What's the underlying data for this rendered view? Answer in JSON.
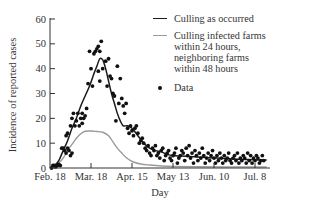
{
  "chart_data": {
    "type": "line",
    "title": "",
    "xlabel": "Day",
    "ylabel": "Incidence of reported cases",
    "ylim": [
      0,
      60
    ],
    "yticks": [
      0,
      10,
      20,
      30,
      40,
      50,
      60
    ],
    "xticks": [
      {
        "label": "Feb. 18",
        "day": 0
      },
      {
        "label": "Mar. 18",
        "day": 28
      },
      {
        "label": "Apr. 15",
        "day": 56
      },
      {
        "label": "May 13",
        "day": 84
      },
      {
        "label": "Jun. 10",
        "day": 112
      },
      {
        "label": "Jul. 8",
        "day": 140
      }
    ],
    "xlim_days": [
      0,
      150
    ],
    "grid": false,
    "legend_position": "upper right",
    "series": [
      {
        "name": "Culling as occurred",
        "style": "line",
        "color": "#1a1a1a",
        "points": [
          [
            0,
            0
          ],
          [
            3,
            1
          ],
          [
            6,
            3
          ],
          [
            9,
            7
          ],
          [
            12,
            11
          ],
          [
            15,
            16
          ],
          [
            18,
            20
          ],
          [
            21,
            25
          ],
          [
            24,
            29
          ],
          [
            27,
            33
          ],
          [
            30,
            38
          ],
          [
            32,
            41
          ],
          [
            34,
            44
          ],
          [
            36,
            43.5
          ],
          [
            38,
            40
          ],
          [
            40,
            35
          ],
          [
            42,
            30
          ],
          [
            44,
            26
          ],
          [
            46,
            22
          ],
          [
            48,
            19
          ],
          [
            50,
            17
          ],
          [
            53,
            17
          ],
          [
            56,
            16
          ],
          [
            60,
            13
          ],
          [
            64,
            10
          ],
          [
            68,
            8
          ],
          [
            72,
            7
          ],
          [
            76,
            6.5
          ],
          [
            80,
            5.5
          ],
          [
            84,
            5
          ],
          [
            90,
            4.8
          ],
          [
            98,
            4.5
          ],
          [
            106,
            4.2
          ],
          [
            114,
            4
          ],
          [
            122,
            3.8
          ],
          [
            130,
            3.5
          ],
          [
            140,
            3.3
          ],
          [
            148,
            3.2
          ]
        ]
      },
      {
        "name": "Culling infected farms within 24 hours, neighboring farms within 48 hours",
        "style": "line",
        "color": "#9a9a9a",
        "points": [
          [
            0,
            0
          ],
          [
            3,
            0.5
          ],
          [
            6,
            2
          ],
          [
            9,
            4
          ],
          [
            12,
            7
          ],
          [
            15,
            9.5
          ],
          [
            18,
            12
          ],
          [
            21,
            13.8
          ],
          [
            24,
            14.8
          ],
          [
            28,
            14.9
          ],
          [
            32,
            14.7
          ],
          [
            36,
            14.4
          ],
          [
            40,
            13
          ],
          [
            43,
            10.5
          ],
          [
            46,
            8
          ],
          [
            49,
            6
          ],
          [
            52,
            4.2
          ],
          [
            55,
            3
          ],
          [
            58,
            2.2
          ],
          [
            62,
            1.6
          ],
          [
            68,
            1.2
          ],
          [
            76,
            0.8
          ],
          [
            84,
            0.6
          ],
          [
            100,
            0.5
          ],
          [
            120,
            0.4
          ],
          [
            148,
            0.4
          ]
        ]
      },
      {
        "name": "Data",
        "style": "scatter",
        "color": "#111111",
        "points": [
          [
            1,
            0
          ],
          [
            2,
            1
          ],
          [
            3,
            1
          ],
          [
            4,
            0.5
          ],
          [
            5,
            1
          ],
          [
            6,
            1.5
          ],
          [
            7,
            1
          ],
          [
            8,
            8
          ],
          [
            9,
            8
          ],
          [
            10,
            7
          ],
          [
            11,
            6
          ],
          [
            12,
            8
          ],
          [
            13,
            7
          ],
          [
            14,
            5
          ],
          [
            15,
            6
          ],
          [
            11,
            13
          ],
          [
            12,
            14
          ],
          [
            14,
            17
          ],
          [
            15,
            20
          ],
          [
            16,
            22
          ],
          [
            17,
            17
          ],
          [
            18,
            19
          ],
          [
            19,
            22
          ],
          [
            20,
            17
          ],
          [
            21,
            20
          ],
          [
            22,
            18
          ],
          [
            23,
            20
          ],
          [
            24,
            21
          ],
          [
            25,
            24
          ],
          [
            22,
            22
          ],
          [
            26,
            34
          ],
          [
            27,
            47
          ],
          [
            28,
            40
          ],
          [
            29,
            33
          ],
          [
            30,
            46
          ],
          [
            31,
            47
          ],
          [
            32,
            48
          ],
          [
            33,
            49
          ],
          [
            34,
            47
          ],
          [
            35,
            51
          ],
          [
            33,
            39
          ],
          [
            34,
            35
          ],
          [
            36,
            40
          ],
          [
            38,
            43
          ],
          [
            39,
            33
          ],
          [
            40,
            44
          ],
          [
            41,
            37
          ],
          [
            42,
            36
          ],
          [
            43,
            30
          ],
          [
            44,
            29
          ],
          [
            45,
            19
          ],
          [
            46,
            41
          ],
          [
            47,
            26
          ],
          [
            48,
            36
          ],
          [
            49,
            28
          ],
          [
            50,
            25
          ],
          [
            51,
            22
          ],
          [
            52,
            26
          ],
          [
            53,
            16
          ],
          [
            54,
            14
          ],
          [
            55,
            17
          ],
          [
            56,
            15
          ],
          [
            57,
            13
          ],
          [
            58,
            16
          ],
          [
            59,
            17
          ],
          [
            60,
            14
          ],
          [
            61,
            10
          ],
          [
            62,
            11
          ],
          [
            63,
            12
          ],
          [
            64,
            10
          ],
          [
            65,
            8
          ],
          [
            66,
            7
          ],
          [
            67,
            9
          ],
          [
            68,
            6
          ],
          [
            69,
            5
          ],
          [
            70,
            8
          ],
          [
            71,
            7
          ],
          [
            72,
            9
          ],
          [
            73,
            5
          ],
          [
            74,
            6
          ],
          [
            75,
            4
          ],
          [
            76,
            7
          ],
          [
            77,
            8
          ],
          [
            78,
            3
          ],
          [
            79,
            5
          ],
          [
            80,
            6
          ],
          [
            81,
            7
          ],
          [
            82,
            4
          ],
          [
            83,
            3
          ],
          [
            84,
            5
          ],
          [
            85,
            6
          ],
          [
            86,
            8
          ],
          [
            87,
            2
          ],
          [
            88,
            4
          ],
          [
            89,
            5
          ],
          [
            90,
            7
          ],
          [
            91,
            6
          ],
          [
            92,
            3
          ],
          [
            93,
            8
          ],
          [
            94,
            5
          ],
          [
            95,
            9
          ],
          [
            96,
            4
          ],
          [
            97,
            6
          ],
          [
            98,
            2
          ],
          [
            99,
            7
          ],
          [
            100,
            5
          ],
          [
            101,
            3
          ],
          [
            102,
            6
          ],
          [
            103,
            4
          ],
          [
            104,
            8
          ],
          [
            105,
            5
          ],
          [
            106,
            2
          ],
          [
            107,
            4
          ],
          [
            108,
            6
          ],
          [
            109,
            3
          ],
          [
            110,
            5
          ],
          [
            111,
            7
          ],
          [
            112,
            4
          ],
          [
            113,
            2
          ],
          [
            114,
            5
          ],
          [
            115,
            3
          ],
          [
            116,
            6
          ],
          [
            117,
            4
          ],
          [
            118,
            2
          ],
          [
            119,
            5
          ],
          [
            120,
            3
          ],
          [
            121,
            4
          ],
          [
            122,
            6
          ],
          [
            123,
            3
          ],
          [
            124,
            2
          ],
          [
            125,
            4
          ],
          [
            126,
            5
          ],
          [
            127,
            3
          ],
          [
            128,
            6
          ],
          [
            129,
            2
          ],
          [
            130,
            4
          ],
          [
            131,
            3
          ],
          [
            132,
            5
          ],
          [
            133,
            4
          ],
          [
            134,
            2
          ],
          [
            135,
            6
          ],
          [
            136,
            3
          ],
          [
            137,
            5
          ],
          [
            138,
            2
          ],
          [
            139,
            4
          ],
          [
            140,
            3
          ],
          [
            141,
            5
          ],
          [
            142,
            4
          ],
          [
            143,
            2
          ],
          [
            144,
            3
          ],
          [
            145,
            5
          ],
          [
            146,
            3
          ]
        ]
      }
    ]
  },
  "legend": {
    "items": [
      {
        "label": "Culling as occurred",
        "kind": "line",
        "color": "#1a1a1a"
      },
      {
        "label": "Culling infected farms\nwithin 24 hours,\nneighboring farms\nwithin 48 hours",
        "kind": "line",
        "color": "#9a9a9a"
      },
      {
        "label": "Data",
        "kind": "dot",
        "color": "#111111"
      }
    ]
  },
  "layout": {
    "x0": 50,
    "y0": 168,
    "yTop": 19,
    "pxPerDay": 1.4643,
    "axisEnd": 270
  }
}
